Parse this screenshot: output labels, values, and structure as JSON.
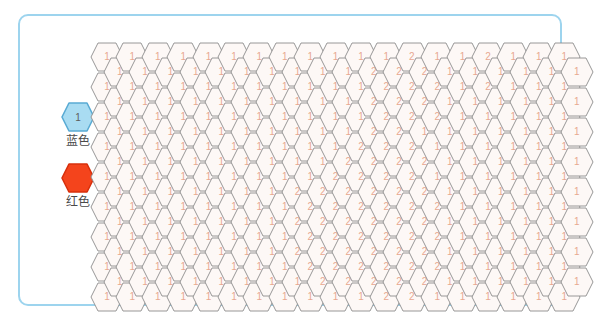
{
  "panel": {
    "border_color": "#9dd4ee",
    "background": "#ffffff"
  },
  "legend": {
    "items": [
      {
        "icon": "hexagon-icon",
        "value": "1",
        "label": "蓝色",
        "fill": "#a9dcf2",
        "stroke": "#5aabd4",
        "number_color": "#5d5d5d"
      },
      {
        "icon": "hexagon-icon",
        "value": "",
        "label": "红色",
        "fill": "#f4441c",
        "stroke": "#d8300c",
        "number_color": "#ffffff"
      }
    ]
  },
  "grid": {
    "type": "hex-grid",
    "orientation": "pointy-side-left",
    "columns": 19,
    "hex_width": 34,
    "hex_height": 30,
    "col_step": 25.4,
    "row_step": 30,
    "row_offset": 15,
    "cell_fill": "#fdf8f6",
    "cell_stroke": "#8c8c8c",
    "number_color": "#e8a891",
    "column_values": [
      [
        "1",
        "1",
        "1",
        "1",
        "1",
        "1",
        "1",
        "1",
        "1"
      ],
      [
        "1",
        "1",
        "1",
        "1",
        "1",
        "1",
        "1",
        "1",
        "1"
      ],
      [
        "1",
        "1",
        "1",
        "1",
        "1",
        "1",
        "1",
        "1",
        "1"
      ],
      [
        "1",
        "1",
        "1",
        "1",
        "1",
        "1",
        "1",
        "1",
        "1"
      ],
      [
        "1",
        "1",
        "1",
        "1",
        "1",
        "1",
        "1",
        "1",
        "1"
      ],
      [
        "1",
        "1",
        "1",
        "1",
        "1",
        "1",
        "1",
        "1",
        "1"
      ],
      [
        "1",
        "1",
        "1",
        "1",
        "1",
        "1",
        "1",
        "1",
        "1"
      ],
      [
        "1",
        "1",
        "1",
        "1",
        "1",
        "1",
        "1",
        "1",
        "1"
      ],
      [
        "1",
        "1",
        "1",
        "1",
        "1",
        "2",
        "2",
        "2",
        "1"
      ],
      [
        "1",
        "1",
        "1",
        "1",
        "2",
        "2",
        "2",
        "2",
        "1"
      ],
      [
        "1",
        "1",
        "1",
        "2",
        "2",
        "2",
        "2",
        "2",
        "1"
      ],
      [
        "1",
        "2",
        "2",
        "2",
        "2",
        "2",
        "2",
        "2",
        "2"
      ],
      [
        "2",
        "2",
        "2",
        "2",
        "2",
        "2",
        "2",
        "2",
        "2"
      ],
      [
        "1",
        "2",
        "2",
        "1",
        "1",
        "2",
        "2",
        "2",
        "1"
      ],
      [
        "1",
        "1",
        "1",
        "1",
        "1",
        "1",
        "1",
        "1",
        "1"
      ],
      [
        "2",
        "2",
        "1",
        "1",
        "1",
        "1",
        "1",
        "1",
        "1"
      ],
      [
        "1",
        "1",
        "1",
        "1",
        "1",
        "1",
        "1",
        "1",
        "1"
      ],
      [
        "1",
        "1",
        "1",
        "1",
        "1",
        "1",
        "1",
        "1",
        "1"
      ],
      [
        "1",
        "1",
        "1",
        "1",
        "1",
        "1",
        "1",
        "1",
        "1"
      ]
    ],
    "column_values_offset": [
      [
        "1",
        "1",
        "1",
        "1",
        "1",
        "1",
        "1",
        "1"
      ],
      [
        "1",
        "1",
        "1",
        "1",
        "1",
        "1",
        "1",
        "1"
      ],
      [
        "1",
        "1",
        "1",
        "1",
        "1",
        "1",
        "1",
        "1"
      ],
      [
        "1",
        "1",
        "1",
        "1",
        "1",
        "1",
        "1",
        "1"
      ],
      [
        "1",
        "1",
        "1",
        "1",
        "1",
        "1",
        "1",
        "1"
      ],
      [
        "1",
        "1",
        "1",
        "1",
        "1",
        "1",
        "1",
        "1"
      ],
      [
        "1",
        "1",
        "1",
        "1",
        "1",
        "1",
        "1",
        "1"
      ],
      [
        "1",
        "1",
        "1",
        "1",
        "2",
        "2",
        "2",
        "1"
      ],
      [
        "1",
        "1",
        "1",
        "1",
        "2",
        "2",
        "2",
        "2"
      ],
      [
        "1",
        "1",
        "1",
        "2",
        "2",
        "2",
        "2",
        "2"
      ],
      [
        "2",
        "2",
        "2",
        "2",
        "2",
        "2",
        "2",
        "2"
      ],
      [
        "2",
        "2",
        "2",
        "2",
        "2",
        "2",
        "2",
        "2"
      ],
      [
        "2",
        "2",
        "1",
        "2",
        "2",
        "2",
        "2",
        "2"
      ],
      [
        "1",
        "1",
        "1",
        "1",
        "1",
        "1",
        "1",
        "1"
      ],
      [
        "1",
        "1",
        "1",
        "1",
        "1",
        "1",
        "1",
        "1"
      ],
      [
        "1",
        "1",
        "1",
        "1",
        "1",
        "1",
        "1",
        "1"
      ],
      [
        "1",
        "1",
        "1",
        "1",
        "1",
        "1",
        "1",
        "1"
      ],
      [
        "1",
        "1",
        "1",
        "1",
        "1",
        "1",
        "1",
        "1"
      ],
      [
        "1",
        "1",
        "1",
        "1",
        "1",
        "1",
        "1",
        "1"
      ]
    ]
  }
}
